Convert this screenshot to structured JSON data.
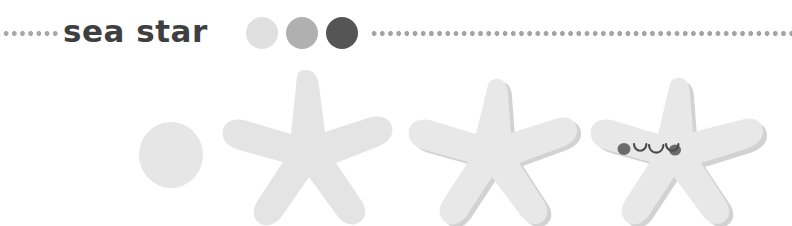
{
  "page": {
    "background_color": "#ffffff",
    "title": "sea star"
  },
  "header": {
    "title": "sea star",
    "rule_left": {
      "name": "dotted-rule-left",
      "color": "#9a9a9a"
    },
    "rule_right": {
      "name": "dotted-rule-right",
      "color": "#8f8f8f"
    },
    "swatches": [
      {
        "name": "color-swatch-light",
        "color": "#e0e0e0"
      },
      {
        "name": "color-swatch-medium",
        "color": "#b0b0b0"
      },
      {
        "name": "color-swatch-dark",
        "color": "#555555"
      }
    ]
  },
  "steps": [
    {
      "name": "step-circle",
      "label": "circle",
      "shape": "circle",
      "fill": "#e6e6e6"
    },
    {
      "name": "step-rough-star",
      "label": "rough star",
      "shape": "five-point-star",
      "fill": "#e4e4e4"
    },
    {
      "name": "step-refined-star",
      "label": "refined star",
      "shape": "five-point-star",
      "fill": "#e8e8e8",
      "shadow": "#d2d2d2"
    },
    {
      "name": "step-finished-star",
      "label": "finished star with face",
      "shape": "five-point-star",
      "fill": "#e8e8e8",
      "shadow": "#d2d2d2",
      "face": {
        "eye_color": "#4a4a4a",
        "mouth_color": "#4a4a4a",
        "blush_color": "#6b6b6b"
      }
    }
  ]
}
